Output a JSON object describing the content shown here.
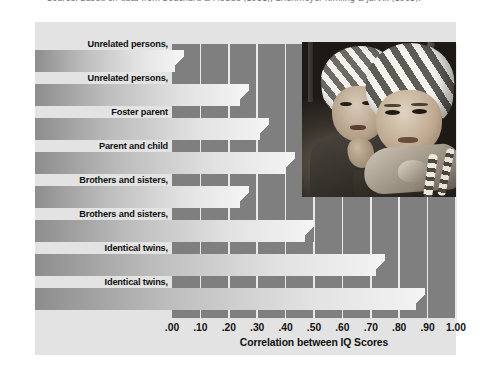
{
  "source_note": "Source: Based on data from Bouchard & McGue (1981); Erlenmeyer-Kimling & Jarvik (1963).",
  "axis_title": "Correlation between IQ Scores",
  "photo": {
    "alt": "Photograph of two young identical twin children wearing matching striped caps"
  },
  "chart_data": {
    "type": "bar",
    "orientation": "horizontal",
    "title": "",
    "xlabel": "Correlation between IQ Scores",
    "ylabel": "",
    "xlim": [
      0.0,
      1.0
    ],
    "grid": true,
    "legend": "none",
    "categories": [
      "Unrelated persons, reared apart",
      "Unrelated persons, reared together",
      "Foster parent and child",
      "Parent and child living together",
      "Brothers and sisters, reared apart",
      "Brothers and sisters, reared together",
      "Identical twins, reared apart",
      "Identical twins, reared together"
    ],
    "category_lines": [
      [
        "Unrelated persons,",
        "reared apart"
      ],
      [
        "Unrelated persons,",
        "reared together"
      ],
      [
        "Foster parent",
        "and child"
      ],
      [
        "Parent and child",
        "living together"
      ],
      [
        "Brothers and sisters,",
        "reared apart"
      ],
      [
        "Brothers and sisters,",
        "reared together"
      ],
      [
        "Identical twins,",
        "reared apart"
      ],
      [
        "Identical twins,",
        "reared together"
      ]
    ],
    "values": [
      0.01,
      0.24,
      0.31,
      0.4,
      0.24,
      0.47,
      0.72,
      0.86
    ],
    "tick_values": [
      0.0,
      0.1,
      0.2,
      0.3,
      0.4,
      0.5,
      0.6,
      0.7,
      0.8,
      0.9,
      1.0
    ],
    "tick_labels": [
      ".00",
      ".10",
      ".20",
      ".30",
      ".40",
      ".50",
      ".60",
      ".70",
      ".80",
      ".90",
      "1.00"
    ]
  },
  "colors": {
    "page_background": "#ffffff",
    "panel_background": "#e3e3e3",
    "plot_background": "#7f7f7f",
    "gridline": "#e9e9e9",
    "bar_light": "#f2f2f2",
    "bar_dark": "#8d8d8d",
    "text": "#111111",
    "source_text": "#6f6f6f"
  }
}
